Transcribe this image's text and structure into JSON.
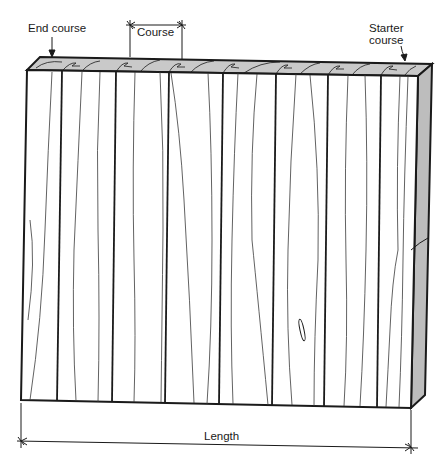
{
  "diagram": {
    "labels": {
      "end_course": "End course",
      "course": "Course",
      "starter_course_line1": "Starter",
      "starter_course_line2": "course",
      "length": "Length"
    },
    "colors": {
      "line": "#1a1a1a",
      "grain": "#3a3a3a",
      "top_face": "#c9c9c9",
      "side_face": "#bdbdbd",
      "front_face": "#ffffff"
    },
    "panel": {
      "boards": 8,
      "board_divider_x_top": [
        62,
        116,
        169,
        223,
        276,
        328,
        381
      ],
      "board_divider_x_bottom": [
        57,
        112,
        165,
        219,
        272,
        324,
        377
      ]
    }
  }
}
